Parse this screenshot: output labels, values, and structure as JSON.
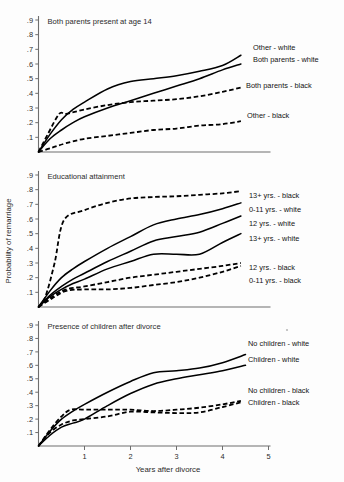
{
  "figure": {
    "xlabel": "Years after divorce",
    "ylabel": "Probability of remarriage",
    "x_ticks": [
      "1",
      "2",
      "3",
      "4",
      "5"
    ],
    "y_ticks": [
      ".9",
      ".8",
      ".7",
      ".6",
      ".5",
      ".4",
      ".3",
      ".2",
      ".1"
    ]
  },
  "chart_data": [
    {
      "type": "line",
      "title": "Both parents present at age 14",
      "xlabel": "Years after divorce",
      "ylabel": "Probability of remarriage",
      "xlim": [
        0,
        5
      ],
      "ylim": [
        0,
        0.95
      ],
      "grid": false,
      "legend_position": "right-inline",
      "series": [
        {
          "name": "Other - white",
          "style": "solid",
          "label": "Other - white",
          "x": [
            0,
            0.25,
            0.5,
            0.75,
            1.0,
            1.5,
            2.0,
            2.5,
            3.0,
            3.5,
            4.0,
            4.4
          ],
          "y": [
            0.0,
            0.12,
            0.22,
            0.29,
            0.34,
            0.43,
            0.48,
            0.5,
            0.52,
            0.55,
            0.59,
            0.66
          ]
        },
        {
          "name": "Both parents - white",
          "style": "solid",
          "label": "Both parents - white",
          "x": [
            0,
            0.25,
            0.5,
            0.75,
            1.0,
            1.5,
            2.0,
            2.5,
            3.0,
            3.5,
            4.0,
            4.4
          ],
          "y": [
            0.0,
            0.09,
            0.15,
            0.2,
            0.24,
            0.3,
            0.35,
            0.4,
            0.45,
            0.5,
            0.56,
            0.6
          ]
        },
        {
          "name": "Both parents - black",
          "style": "dashed",
          "label": "Both parents - black",
          "x": [
            0,
            0.2,
            0.45,
            0.6,
            1.0,
            1.5,
            2.0,
            2.5,
            3.0,
            3.5,
            4.0,
            4.4
          ],
          "y": [
            0.0,
            0.12,
            0.26,
            0.26,
            0.29,
            0.32,
            0.34,
            0.35,
            0.36,
            0.38,
            0.41,
            0.44
          ]
        },
        {
          "name": "Other - black",
          "style": "dashed",
          "label": "Other - black",
          "x": [
            0,
            0.3,
            0.6,
            1.0,
            1.5,
            2.0,
            2.5,
            3.0,
            3.5,
            4.0,
            4.4
          ],
          "y": [
            0.0,
            0.03,
            0.06,
            0.09,
            0.11,
            0.13,
            0.15,
            0.16,
            0.18,
            0.19,
            0.21
          ]
        }
      ]
    },
    {
      "type": "line",
      "title": "Educational attainment",
      "xlabel": "Years after divorce",
      "ylabel": "Probability of remarriage",
      "xlim": [
        0,
        5
      ],
      "ylim": [
        0,
        0.95
      ],
      "grid": false,
      "legend_position": "right-inline",
      "series": [
        {
          "name": "13+ yrs. - black",
          "style": "dashed",
          "label": "13+ yrs. - black",
          "x": [
            0,
            0.15,
            0.35,
            0.55,
            1.0,
            1.5,
            2.0,
            2.5,
            3.0,
            3.5,
            4.0,
            4.4
          ],
          "y": [
            0.0,
            0.07,
            0.3,
            0.59,
            0.66,
            0.71,
            0.74,
            0.75,
            0.755,
            0.765,
            0.775,
            0.79
          ]
        },
        {
          "name": "0-11 yrs. - white",
          "style": "solid",
          "label": "0-11 yrs. - white",
          "x": [
            0,
            0.25,
            0.5,
            0.75,
            1.0,
            1.5,
            2.0,
            2.5,
            3.0,
            3.5,
            4.0,
            4.4
          ],
          "y": [
            0.0,
            0.11,
            0.2,
            0.26,
            0.31,
            0.4,
            0.48,
            0.56,
            0.6,
            0.63,
            0.67,
            0.71
          ]
        },
        {
          "name": "12 yrs. - white",
          "style": "solid",
          "label": "12 yrs. - white",
          "x": [
            0,
            0.25,
            0.5,
            0.75,
            1.0,
            1.5,
            2.0,
            2.5,
            3.0,
            3.5,
            4.0,
            4.4
          ],
          "y": [
            0.0,
            0.08,
            0.14,
            0.19,
            0.23,
            0.31,
            0.38,
            0.45,
            0.48,
            0.51,
            0.57,
            0.62
          ]
        },
        {
          "name": "13+ yrs. - white",
          "style": "solid",
          "label": "13+ yrs. - white",
          "x": [
            0,
            0.25,
            0.5,
            0.75,
            1.0,
            1.5,
            2.0,
            2.5,
            3.0,
            3.5,
            4.0,
            4.4
          ],
          "y": [
            0.0,
            0.07,
            0.12,
            0.16,
            0.19,
            0.26,
            0.31,
            0.36,
            0.36,
            0.36,
            0.44,
            0.5
          ]
        },
        {
          "name": "12 yrs. - black",
          "style": "dashed",
          "label": "12 yrs. - black",
          "x": [
            0,
            0.3,
            0.6,
            1.0,
            1.5,
            2.0,
            2.5,
            3.0,
            3.5,
            4.0,
            4.4
          ],
          "y": [
            0.0,
            0.07,
            0.12,
            0.14,
            0.17,
            0.2,
            0.22,
            0.24,
            0.26,
            0.28,
            0.3
          ]
        },
        {
          "name": "0-11 yrs. - black",
          "style": "dashed",
          "label": "0-11 yrs. - black",
          "x": [
            0,
            0.3,
            0.6,
            1.0,
            1.5,
            2.0,
            2.5,
            3.0,
            3.5,
            4.0,
            4.4
          ],
          "y": [
            0.0,
            0.06,
            0.11,
            0.12,
            0.12,
            0.13,
            0.15,
            0.17,
            0.2,
            0.24,
            0.28
          ]
        }
      ]
    },
    {
      "type": "line",
      "title": "Presence of children after divorce",
      "xlabel": "Years after divorce",
      "ylabel": "Probability of remarriage",
      "xlim": [
        0,
        5
      ],
      "ylim": [
        0,
        0.95
      ],
      "grid": false,
      "legend_position": "right-inline",
      "series": [
        {
          "name": "No children - white",
          "style": "solid",
          "label": "No children - white",
          "x": [
            0,
            0.25,
            0.5,
            0.75,
            1.0,
            1.5,
            2.0,
            2.5,
            3.0,
            3.5,
            4.0,
            4.5
          ],
          "y": [
            0.0,
            0.11,
            0.2,
            0.26,
            0.31,
            0.4,
            0.48,
            0.545,
            0.56,
            0.58,
            0.62,
            0.68
          ]
        },
        {
          "name": "Children - white",
          "style": "solid",
          "label": "Children - white",
          "x": [
            0,
            0.25,
            0.5,
            0.75,
            1.0,
            1.5,
            2.0,
            2.5,
            3.0,
            3.5,
            4.0,
            4.5
          ],
          "y": [
            0.0,
            0.08,
            0.14,
            0.17,
            0.2,
            0.3,
            0.39,
            0.46,
            0.5,
            0.53,
            0.56,
            0.6
          ]
        },
        {
          "name": "No children - black",
          "style": "dashed",
          "label": "No children - black",
          "x": [
            0,
            0.25,
            0.5,
            0.7,
            1.0,
            1.5,
            2.0,
            2.5,
            3.0,
            3.5,
            4.0,
            4.4
          ],
          "y": [
            0.0,
            0.12,
            0.22,
            0.27,
            0.27,
            0.27,
            0.27,
            0.26,
            0.27,
            0.285,
            0.31,
            0.335
          ]
        },
        {
          "name": "Children - black",
          "style": "dashed",
          "label": "Children - black",
          "x": [
            0,
            0.25,
            0.5,
            0.75,
            1.0,
            1.5,
            2.0,
            2.5,
            3.0,
            3.5,
            4.0,
            4.4
          ],
          "y": [
            0.0,
            0.1,
            0.16,
            0.19,
            0.2,
            0.22,
            0.255,
            0.25,
            0.245,
            0.25,
            0.29,
            0.325
          ]
        }
      ]
    }
  ],
  "panels": [
    {
      "id": "panel-parents",
      "title": "Both parents present at age 14",
      "labels": [
        {
          "text": "Other - white",
          "x": 253,
          "y": 50
        },
        {
          "text": "Both parents - white",
          "x": 253,
          "y": 62
        },
        {
          "text": "Both parents - black",
          "x": 246,
          "y": 88
        },
        {
          "text": "Other - black",
          "x": 247,
          "y": 118
        }
      ]
    },
    {
      "id": "panel-education",
      "title": "Educational attainment",
      "labels": [
        {
          "text": "13+ yrs. - black",
          "x": 249,
          "y": 198
        },
        {
          "text": "0-11 yrs. - white",
          "x": 249,
          "y": 212
        },
        {
          "text": "12 yrs. - white",
          "x": 249,
          "y": 226
        },
        {
          "text": "13+ yrs. - white",
          "x": 249,
          "y": 241
        },
        {
          "text": "12 yrs. - black",
          "x": 249,
          "y": 270
        },
        {
          "text": "0-11 yrs. - black",
          "x": 249,
          "y": 283
        }
      ]
    },
    {
      "id": "panel-children",
      "title": "Presence of children after divorce",
      "labels": [
        {
          "text": "No children - white",
          "x": 248,
          "y": 346
        },
        {
          "text": "Children - white",
          "x": 248,
          "y": 362
        },
        {
          "text": "No children - black",
          "x": 248,
          "y": 393
        },
        {
          "text": "Children - black",
          "x": 248,
          "y": 405
        }
      ]
    }
  ]
}
